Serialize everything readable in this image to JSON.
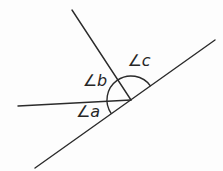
{
  "figure": {
    "background": "#fdfdfd",
    "line_color": "#2b2b2b",
    "line_width": 1.4,
    "label_font_size": 16,
    "labels": [
      {
        "name": "angle-a-label",
        "text": "∠a",
        "x": 88,
        "y": 117
      },
      {
        "name": "angle-b-label",
        "text": "∠b",
        "x": 95,
        "y": 86
      },
      {
        "name": "angle-c-label",
        "text": "∠c",
        "x": 139,
        "y": 66
      }
    ],
    "geometry": {
      "vertex": {
        "x": 131,
        "y": 100
      },
      "lines": [
        {
          "name": "transversal-line",
          "x1": 35,
          "y1": 168,
          "x2": 215,
          "y2": 40
        },
        {
          "name": "upper-left-ray",
          "x1": 131,
          "y1": 100,
          "x2": 72,
          "y2": 10
        },
        {
          "name": "left-ray",
          "x1": 131,
          "y1": 100,
          "x2": 18,
          "y2": 106
        }
      ],
      "arc": {
        "name": "angle-arc",
        "radius": 24,
        "path": "M 150.6 86.1 A 24 24 0 0 0 111.4 113.9"
      }
    }
  }
}
